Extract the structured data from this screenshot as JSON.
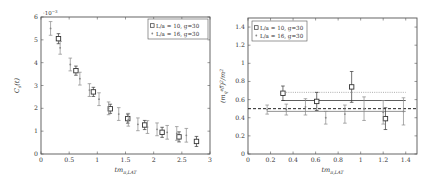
{
  "chart_data": [
    {
      "type": "scatter",
      "title": "",
      "xlabel": "tm_{π,LAT}",
      "ylabel": "C_s(t)",
      "y_scale_label": "10^-3",
      "xlim": [
        0,
        3
      ],
      "ylim": [
        0,
        6
      ],
      "xticks": [
        0,
        0.5,
        1,
        1.5,
        2,
        2.5,
        3
      ],
      "xtick_labels": [
        "0",
        "0.5",
        "1",
        "1.5",
        "2",
        "2.5",
        "3"
      ],
      "yticks": [
        0,
        1,
        2,
        3,
        4,
        5,
        6
      ],
      "ytick_labels": [
        "0",
        "1",
        "2",
        "3",
        "4",
        "5",
        "6"
      ],
      "grid": false,
      "legend_position": "upper right",
      "series": [
        {
          "name": "L/a = 10, g=30",
          "marker": "square",
          "x": [
            0.31,
            0.62,
            0.93,
            1.23,
            1.54,
            1.84,
            2.15,
            2.45,
            2.76
          ],
          "y": [
            5.05,
            3.65,
            2.72,
            1.98,
            1.55,
            1.27,
            0.95,
            0.75,
            0.55
          ],
          "err": [
            0.22,
            0.2,
            0.2,
            0.2,
            0.2,
            0.2,
            0.22,
            0.22,
            0.22
          ]
        },
        {
          "name": "L/a = 16, g=30",
          "marker": "dot",
          "x": [
            0.17,
            0.34,
            0.52,
            0.69,
            0.86,
            1.03,
            1.2,
            1.38,
            1.55,
            1.72,
            1.89,
            2.06,
            2.24,
            2.41,
            2.58
          ],
          "y": [
            5.5,
            4.65,
            3.92,
            3.3,
            2.8,
            2.4,
            2.0,
            1.75,
            1.5,
            1.3,
            1.18,
            1.08,
            0.95,
            0.9,
            0.82
          ],
          "err": [
            0.3,
            0.28,
            0.28,
            0.28,
            0.28,
            0.28,
            0.28,
            0.28,
            0.28,
            0.28,
            0.28,
            0.28,
            0.3,
            0.3,
            0.3
          ]
        }
      ]
    },
    {
      "type": "scatter",
      "title": "",
      "xlabel": "tm_{π,LAT}",
      "ylabel": "(m_q^eff)^2/m^2",
      "xlim": [
        0,
        1.5
      ],
      "ylim": [
        0,
        1.5
      ],
      "xticks": [
        0,
        0.2,
        0.4,
        0.6,
        0.8,
        1,
        1.2,
        1.4
      ],
      "xtick_labels": [
        "0",
        "0.2",
        "0.4",
        "0.6",
        "0.8",
        "1",
        "1.2",
        "1.4"
      ],
      "yticks": [
        0,
        0.2,
        0.4,
        0.6,
        0.8,
        1,
        1.2,
        1.4
      ],
      "ytick_labels": [
        "0",
        "0.2",
        "0.4",
        "0.6",
        "0.8",
        "1",
        "1.2",
        "1.4"
      ],
      "grid": false,
      "legend_position": "upper left",
      "series": [
        {
          "name": "L/a = 10, g=30",
          "marker": "square",
          "x": [
            0.31,
            0.61,
            0.92,
            1.22
          ],
          "y": [
            0.67,
            0.58,
            0.74,
            0.39
          ],
          "err": [
            0.08,
            0.1,
            0.17,
            0.12
          ]
        },
        {
          "name": "L/a = 16, g=30",
          "marker": "dot",
          "x": [
            0.17,
            0.34,
            0.51,
            0.69,
            0.86,
            1.03,
            1.2,
            1.38
          ],
          "y": [
            0.49,
            0.49,
            0.52,
            0.4,
            0.44,
            0.5,
            0.46,
            0.47
          ],
          "err": [
            0.05,
            0.06,
            0.09,
            0.07,
            0.1,
            0.13,
            0.13,
            0.15
          ]
        }
      ],
      "reference_lines": [
        {
          "y": 0.5,
          "style": "dashed",
          "color": "#222222",
          "x_from": 0,
          "x_to": 1.5
        },
        {
          "y": 0.59,
          "style": "solid",
          "color": "#333333",
          "x_from": 0.3,
          "x_to": 1.4
        },
        {
          "y": 0.68,
          "style": "dotted",
          "color": "#999999",
          "x_from": 0.3,
          "x_to": 1.4
        },
        {
          "y": 0.47,
          "style": "solid",
          "color": "#777777",
          "x_from": 0.17,
          "x_to": 1.4
        }
      ]
    }
  ],
  "colors": {
    "axis": "#555555",
    "series_square": "#333333",
    "series_dot": "#888888"
  }
}
